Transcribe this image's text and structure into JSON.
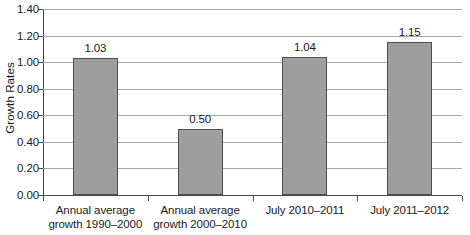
{
  "chart_data": {
    "type": "bar",
    "title": "",
    "xlabel": "",
    "ylabel": "Growth Rates",
    "ylim": [
      0.0,
      1.4
    ],
    "ytick_step": 0.2,
    "grid": true,
    "legend": "none",
    "categories": [
      "Annual average growth 1990–2000",
      "Annual average growth 2000–2010",
      "July 2010–2011",
      "July 2011–2012"
    ],
    "category_lines": [
      [
        "Annual average",
        "growth 1990–2000"
      ],
      [
        "Annual average",
        "growth 2000–2010"
      ],
      [
        "July 2010–2011"
      ],
      [
        "July 2011–2012"
      ]
    ],
    "values": [
      1.03,
      0.5,
      1.04,
      1.15
    ],
    "value_labels": [
      "1.03",
      "0.50",
      "1.04",
      "1.15"
    ],
    "ytick_labels": [
      "0.00",
      "0.20",
      "0.40",
      "0.60",
      "0.80",
      "1.00",
      "1.20",
      "1.40"
    ],
    "ytick_values": [
      0.0,
      0.2,
      0.4,
      0.6,
      0.8,
      1.0,
      1.2,
      1.4
    ],
    "colors": {
      "bar_fill": "#9e9e9e",
      "bar_border": "#4d4d4d",
      "gridline": "#a8a8a8",
      "axis": "#4a4a4a",
      "text": "#1a1a1a",
      "background": "#ffffff"
    }
  }
}
